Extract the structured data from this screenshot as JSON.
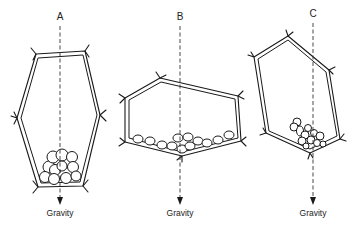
{
  "figure": {
    "line_color": "#1a1a1a",
    "background": "#ffffff"
  },
  "cells": [
    {
      "id": "A",
      "label": "A",
      "gravity_label": "Gravity",
      "orientation": "upright",
      "label_pos": [
        60,
        20
      ],
      "axis_x": 60,
      "axis_top": 26,
      "axis_bottom": 204,
      "gravity_text_pos": [
        60,
        216
      ]
    },
    {
      "id": "B",
      "label": "B",
      "gravity_label": "Gravity",
      "orientation": "horizontal",
      "label_pos": [
        180,
        20
      ],
      "axis_x": 180,
      "axis_top": 26,
      "axis_bottom": 204,
      "gravity_text_pos": [
        180,
        216
      ]
    },
    {
      "id": "C",
      "label": "C",
      "gravity_label": "Gravity",
      "orientation": "tilted",
      "label_pos": [
        313,
        17
      ],
      "axis_x": 313,
      "axis_top": 23,
      "axis_bottom": 204,
      "gravity_text_pos": [
        313,
        216
      ]
    }
  ]
}
